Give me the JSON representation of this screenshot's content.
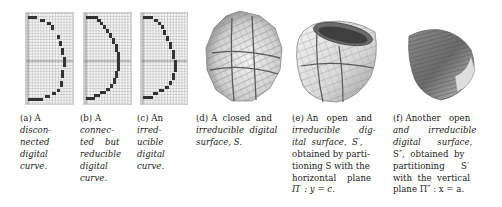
{
  "figure": {
    "subfigures": [
      {
        "id": "a",
        "label": "(a)",
        "caption_lines": [
          "(a) A",
          "discon-",
          "nected",
          "digital",
          "curve."
        ],
        "kind": "digital-curve",
        "variant": "disconnected"
      },
      {
        "id": "b",
        "label": "(b)",
        "caption_lines": [
          "(b) A",
          "connec-",
          "ted    but",
          "reducible",
          "digital",
          "curve."
        ],
        "kind": "digital-curve",
        "variant": "connected-reducible"
      },
      {
        "id": "c",
        "label": "(c)",
        "caption_lines": [
          "(c) An",
          "irred-",
          "ucible",
          "digital",
          "curve."
        ],
        "kind": "digital-curve",
        "variant": "irreducible"
      },
      {
        "id": "d",
        "label": "(d)",
        "caption_lines": [
          "(d) A  closed  and",
          "irreducible  digital",
          "surface, S."
        ],
        "kind": "digital-surface",
        "variant": "closed"
      },
      {
        "id": "e",
        "label": "(e)",
        "caption_lines": [
          "(e) An   open   and",
          "irreducible       dig-",
          "ital  surface,  S′,",
          "obtained by parti-",
          "tioning S with the",
          "horizontal    plane",
          "Π′ : y = c."
        ],
        "kind": "digital-surface",
        "variant": "open-horizontal-cut"
      },
      {
        "id": "f",
        "label": "(f)",
        "caption_lines": [
          "(f) Another   open",
          "and       irreducible",
          "digital      surface,",
          "S″,  obtained  by",
          "partitioning      S′",
          "with  the  vertical",
          "plane Π″ : x = a."
        ],
        "kind": "digital-surface",
        "variant": "open-vertical-cut"
      }
    ]
  },
  "colors": {
    "pixel": "#333333",
    "grid_line": "#c8c8c8",
    "axis": "#777777",
    "surface_light": "#f2f2f2",
    "surface_mid": "#bdbdbd",
    "surface_dark": "#555555"
  }
}
